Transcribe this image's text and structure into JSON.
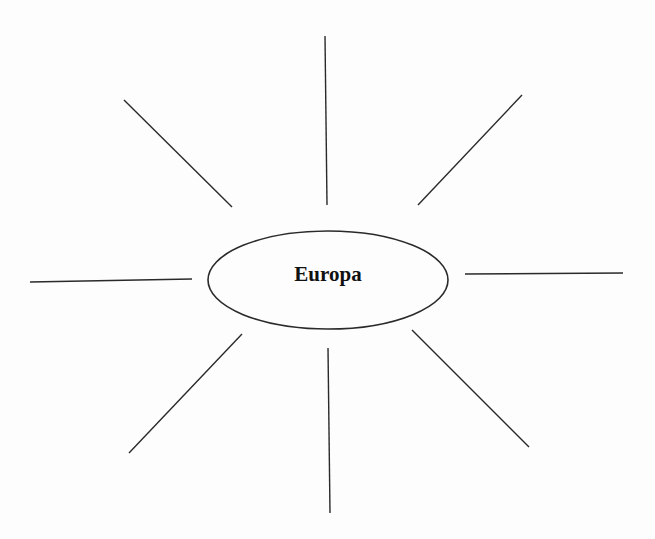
{
  "diagram": {
    "type": "mind-map",
    "center_label": "Europa",
    "stroke_color": "#2a2a2a",
    "center_node": {
      "cx": 328,
      "cy": 280,
      "rx": 120,
      "ry": 49
    },
    "branches": [
      {
        "name": "branch-top-left",
        "x1": 124,
        "y1": 100,
        "x2": 232,
        "y2": 207
      },
      {
        "name": "branch-top",
        "x1": 325,
        "y1": 36,
        "x2": 327,
        "y2": 205
      },
      {
        "name": "branch-top-right",
        "x1": 522,
        "y1": 95,
        "x2": 418,
        "y2": 205
      },
      {
        "name": "branch-left",
        "x1": 30,
        "y1": 282,
        "x2": 192,
        "y2": 279
      },
      {
        "name": "branch-right",
        "x1": 465,
        "y1": 274,
        "x2": 623,
        "y2": 273
      },
      {
        "name": "branch-bottom-left",
        "x1": 242,
        "y1": 334,
        "x2": 129,
        "y2": 453
      },
      {
        "name": "branch-bottom",
        "x1": 328,
        "y1": 348,
        "x2": 330,
        "y2": 513
      },
      {
        "name": "branch-bottom-right",
        "x1": 412,
        "y1": 330,
        "x2": 529,
        "y2": 447
      }
    ]
  }
}
